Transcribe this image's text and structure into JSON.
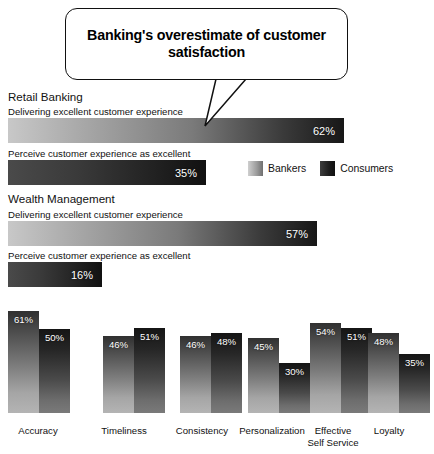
{
  "callout": {
    "title": "Banking's overestimate of customer satisfaction"
  },
  "sections": [
    {
      "heading": "Retail Banking",
      "rows": [
        {
          "label": "Delivering excellent customer experience",
          "value": "62%",
          "pct": 62,
          "series": "bankers"
        },
        {
          "label": "Perceive customer experience as excellent",
          "value": "35%",
          "pct": 35,
          "series": "consumers"
        }
      ]
    },
    {
      "heading": "Wealth Management",
      "rows": [
        {
          "label": "Delivering excellent customer experience",
          "value": "57%",
          "pct": 57,
          "series": "bankers"
        },
        {
          "label": "Perceive customer experience as excellent",
          "value": "16%",
          "pct": 16,
          "series": "consumers"
        }
      ]
    }
  ],
  "legend": {
    "bankers_label": "Bankers",
    "consumers_label": "Consumers",
    "bankers_color": "#9a9a9a",
    "consumers_color": "#1d1d1d"
  },
  "chart_data": {
    "type": "bar",
    "title": "Banking's overestimate of customer satisfaction",
    "xlabel": "",
    "ylabel": "",
    "ylim": [
      0,
      70
    ],
    "grid": false,
    "legend_position": "upper-right-of-35pct-bar",
    "categories": [
      "Accuracy",
      "Timeliness",
      "Consistency",
      "Personalization",
      "Effective Self Service",
      "Loyalty"
    ],
    "series": [
      {
        "name": "Bankers",
        "values": [
          61,
          46,
          46,
          45,
          54,
          48
        ],
        "labels": [
          "61%",
          "46%",
          "46%",
          "45%",
          "54%",
          "48%"
        ]
      },
      {
        "name": "Consumers",
        "values": [
          50,
          51,
          48,
          30,
          51,
          35
        ],
        "labels": [
          "50%",
          "51%",
          "48%",
          "30%",
          "51%",
          "35%"
        ]
      }
    ],
    "secondary_charts": [
      {
        "type": "bar",
        "orientation": "horizontal",
        "group": "Retail Banking",
        "categories": [
          "Delivering excellent customer experience",
          "Perceive customer experience as excellent"
        ],
        "series": [
          {
            "name": "Bankers",
            "values": [
              62,
              null
            ],
            "labels": [
              "62%",
              ""
            ]
          },
          {
            "name": "Consumers",
            "values": [
              null,
              35
            ],
            "labels": [
              "",
              "35%"
            ]
          }
        ]
      },
      {
        "type": "bar",
        "orientation": "horizontal",
        "group": "Wealth Management",
        "categories": [
          "Delivering excellent customer experience",
          "Perceive customer experience as excellent"
        ],
        "series": [
          {
            "name": "Bankers",
            "values": [
              57,
              null
            ],
            "labels": [
              "57%",
              ""
            ]
          },
          {
            "name": "Consumers",
            "values": [
              null,
              16
            ],
            "labels": [
              "",
              "16%"
            ]
          }
        ]
      }
    ]
  }
}
